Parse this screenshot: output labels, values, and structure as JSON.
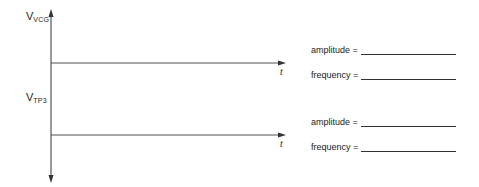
{
  "diagram": {
    "vertical_axis": {
      "top_label": {
        "main": "V",
        "sub": "VCG"
      },
      "mid_label": {
        "main": "V",
        "sub": "TP3"
      }
    },
    "traces": [
      {
        "name": "VCG",
        "time_label": "t",
        "fields": [
          {
            "label": "amplitude =",
            "value": ""
          },
          {
            "label": "frequency =",
            "value": ""
          }
        ]
      },
      {
        "name": "TP3",
        "time_label": "t",
        "fields": [
          {
            "label": "amplitude =",
            "value": ""
          },
          {
            "label": "frequency =",
            "value": ""
          }
        ]
      }
    ],
    "colors": {
      "line": "#555555",
      "text": "#222222",
      "background": "#ffffff"
    }
  }
}
